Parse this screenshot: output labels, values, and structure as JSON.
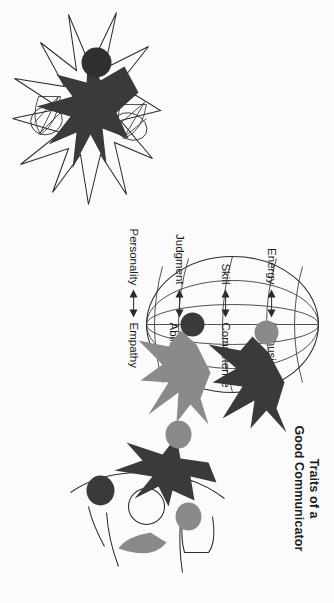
{
  "page": {
    "background_color": "#fbfbfb",
    "orientation": "rotated-90-clockwise",
    "width": 334,
    "height": 603
  },
  "palette": {
    "dark_figure": "#3a3a3a",
    "gray_figure": "#8a8a8a",
    "ink": "#2b2b2b",
    "text": "#1b1b1b",
    "background": "#fbfbfb"
  },
  "titles": {
    "communicator": "Traits of a\nGood Communicator",
    "manager": "Traits of a\nGood Manager"
  },
  "traits": {
    "caption": "Paired traits connected by double-headed arrows",
    "rows": [
      {
        "manager_side": "Energy",
        "communicator_side": "Enthusiasm",
        "arrow": "double-headed"
      },
      {
        "manager_side": "Skill",
        "communicator_side": "Competence",
        "arrow": "double-headed"
      },
      {
        "manager_side": "Judgment",
        "communicator_side": "Listening\nAbility",
        "arrow": "double-headed"
      },
      {
        "manager_side": "Personality",
        "communicator_side": "Empathy",
        "arrow": "double-headed"
      }
    ]
  },
  "illustrations": {
    "globe": {
      "name": "wireframe-globe-with-two-figures",
      "description": "Wireframe sphere with latitude and longitude lines, two star-shaped human figures with round heads",
      "figures": [
        {
          "fill": "#3a3a3a",
          "head_fill": "#8a8a8a"
        },
        {
          "fill": "#8a8a8a",
          "head_fill": "#3a3a3a"
        }
      ]
    },
    "communicator": {
      "name": "communicator-figure-group",
      "description": "Dark star-shaped figure with speech-bubble shapes, gray and dark circular heads and outlined arc forms"
    },
    "manager": {
      "name": "manager-starburst-figure",
      "description": "Dark star-shaped figure with round head inside a radiating starburst outline"
    }
  }
}
